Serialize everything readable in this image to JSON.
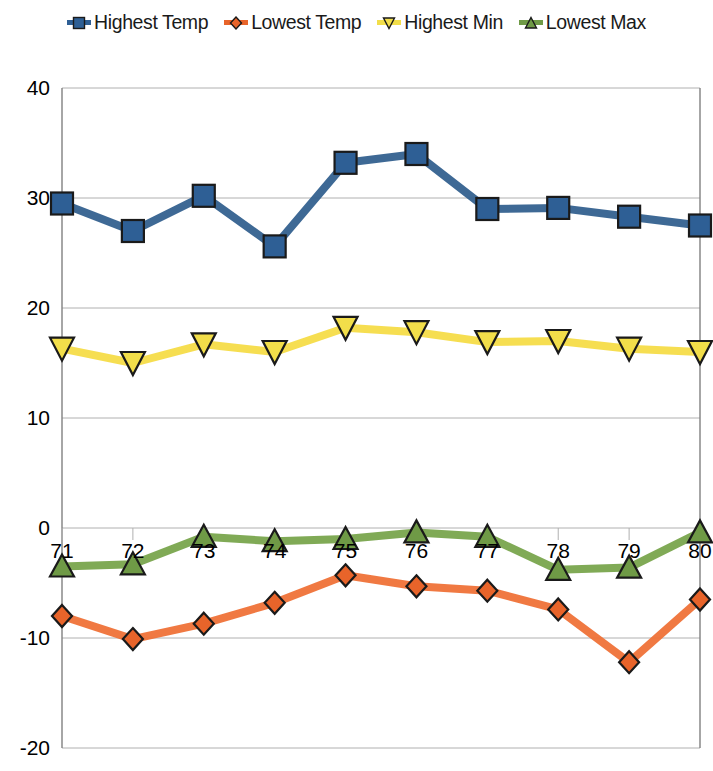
{
  "chart_data": {
    "type": "line",
    "title": "",
    "subtitle": "",
    "xlabel": "",
    "ylabel": "",
    "x": [
      "71",
      "72",
      "73",
      "74",
      "75",
      "76",
      "77",
      "78",
      "79",
      "80"
    ],
    "categories": [
      "71",
      "72",
      "73",
      "74",
      "75",
      "76",
      "77",
      "78",
      "79",
      "80"
    ],
    "xtick_labels": [
      "71",
      "72",
      "73",
      "74",
      "75",
      "76",
      "77",
      "78",
      "79",
      "80"
    ],
    "ytick_labels": [
      "40",
      "30",
      "20",
      "10",
      "0",
      "-10",
      "-20"
    ],
    "ytick_values": [
      40,
      30,
      20,
      10,
      0,
      -10,
      -20
    ],
    "ylim": [
      -20,
      40
    ],
    "xlim": [
      71,
      80
    ],
    "grid": "horizontal",
    "legend_position": "top",
    "series": [
      {
        "name": "Highest Temp",
        "color": "#2e5f95",
        "line_color": "#34618f",
        "marker": "square",
        "values": [
          29.5,
          27.0,
          30.2,
          25.6,
          33.2,
          34.0,
          29.0,
          29.1,
          28.3,
          27.5
        ]
      },
      {
        "name": "Lowest Temp",
        "color": "#e8642a",
        "line_color": "#ef7238",
        "marker": "diamond",
        "values": [
          -8.0,
          -10.1,
          -8.7,
          -6.8,
          -4.3,
          -5.3,
          -5.7,
          -7.4,
          -12.2,
          -6.5
        ]
      },
      {
        "name": "Highest Min",
        "color": "#f2de4a",
        "line_color": "#f6dc48",
        "marker": "triangle-down",
        "values": [
          16.3,
          15.0,
          16.7,
          16.0,
          18.2,
          17.8,
          16.9,
          17.0,
          16.3,
          16.0
        ]
      },
      {
        "name": "Lowest Max",
        "color": "#6f9a46",
        "line_color": "#79a54d",
        "marker": "triangle-up",
        "values": [
          -3.5,
          -3.3,
          -0.8,
          -1.2,
          -1.0,
          -0.4,
          -0.8,
          -3.8,
          -3.6,
          -0.4
        ]
      }
    ]
  },
  "legend": {
    "items": [
      {
        "label": "Highest Temp",
        "marker": "square-marker",
        "color": "#2e5f95"
      },
      {
        "label": "Lowest Temp",
        "marker": "diamond-marker",
        "color": "#e8642a"
      },
      {
        "label": "Highest Min",
        "marker": "triangle-down-marker",
        "color": "#f2de4a"
      },
      {
        "label": "Lowest Max",
        "marker": "triangle-up-marker",
        "color": "#6f9a46"
      }
    ]
  },
  "axes": {
    "y_labels": [
      "40",
      "30",
      "20",
      "10",
      "0",
      "-10",
      "-20"
    ],
    "x_labels": [
      "71",
      "72",
      "73",
      "74",
      "75",
      "76",
      "77",
      "78",
      "79",
      "80"
    ]
  },
  "colors": {
    "highest_temp": "#2e5f95",
    "lowest_temp": "#e8642a",
    "highest_min": "#f2de4a",
    "lowest_max": "#6f9a46",
    "gridline": "#b0b0b0",
    "axis": "#808080",
    "background": "#ffffff"
  }
}
